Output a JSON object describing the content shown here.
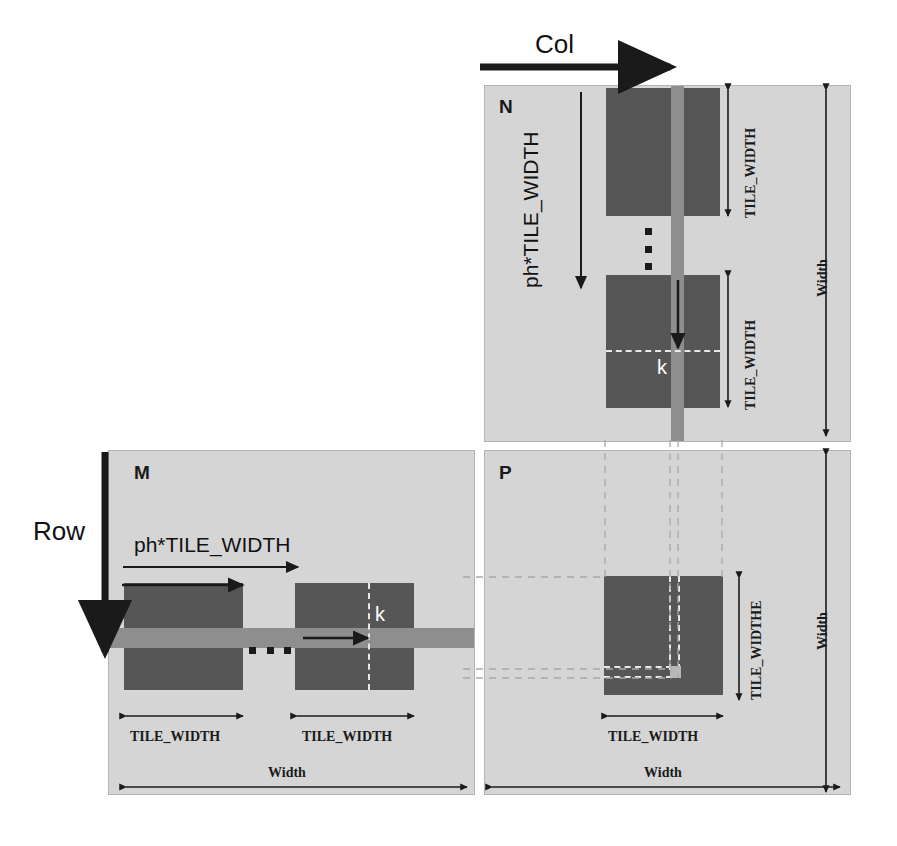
{
  "figure": {
    "axes": {
      "col_label": "Col",
      "row_label": "Row"
    },
    "panels": [
      {
        "id": "N",
        "name": "N",
        "stride_label": "ph*TILE_WIDTH",
        "tile_label_top": "TILE_WIDTH",
        "tile_label_bottom": "TILE_WIDTH",
        "extent_label": "Width",
        "element_label": "k"
      },
      {
        "id": "M",
        "name": "M",
        "stride_label": "ph*TILE_WIDTH",
        "tile_label_left": "TILE_WIDTH",
        "tile_label_right": "TILE_WIDTH",
        "extent_label": "Width",
        "element_label": "k"
      },
      {
        "id": "P",
        "name": "P",
        "tile_label_vertical": "TILE_WIDTHE",
        "tile_label_horizontal": "TILE_WIDTH",
        "extent_label_horizontal": "Width",
        "extent_label_vertical": "Width"
      }
    ],
    "colors": {
      "panel_fill": "#d5d5d5",
      "tile_fill": "#565656",
      "band_fill": "#8e8e8e",
      "marker_fill": "#b8b8b8",
      "arrow_stroke": "#1a1a1a",
      "dashed_white": "#e8e8e8",
      "dashed_gray": "#a8a8a8",
      "page_background": "#ffffff"
    }
  }
}
